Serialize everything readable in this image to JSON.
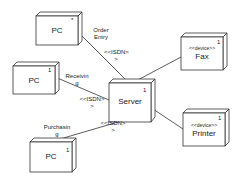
{
  "diagram": {
    "type": "UML deployment diagram",
    "nodes": [
      {
        "id": "pc_order",
        "name": "PC",
        "stereotype": "",
        "multiplicity": "*"
      },
      {
        "id": "pc_receiving",
        "name": "PC",
        "stereotype": "",
        "multiplicity": "1"
      },
      {
        "id": "pc_purchasing",
        "name": "PC",
        "stereotype": "",
        "multiplicity": "1"
      },
      {
        "id": "server",
        "name": "Server",
        "stereotype": "",
        "multiplicity": "1"
      },
      {
        "id": "fax",
        "name": "Fax",
        "stereotype": "<<device>>",
        "multiplicity": "1"
      },
      {
        "id": "printer",
        "name": "Printer",
        "stereotype": "<<device>>",
        "multiplicity": "1"
      }
    ],
    "connections": [
      {
        "from": "pc_order",
        "to": "server",
        "role": "Order Entry",
        "role_lines": [
          "Order",
          "Entry"
        ],
        "stereotype_lines": [
          "<<ISDN>",
          ">"
        ]
      },
      {
        "from": "pc_receiving",
        "to": "server",
        "role": "Receiving",
        "role_lines": [
          "Receivin",
          "g"
        ],
        "stereotype_lines": [
          "<<ISDN>",
          ">"
        ]
      },
      {
        "from": "pc_purchasing",
        "to": "server",
        "role": "Purchasing",
        "role_lines": [
          "Purchasin",
          "g"
        ],
        "stereotype_lines": [
          "<<ISDN>",
          ">"
        ]
      },
      {
        "from": "server",
        "to": "fax",
        "role": "",
        "role_lines": [],
        "stereotype_lines": []
      },
      {
        "from": "server",
        "to": "printer",
        "role": "",
        "role_lines": [],
        "stereotype_lines": []
      }
    ]
  },
  "colors": {
    "line": "#333333",
    "fill": "#ffffff",
    "text": "#222222"
  }
}
